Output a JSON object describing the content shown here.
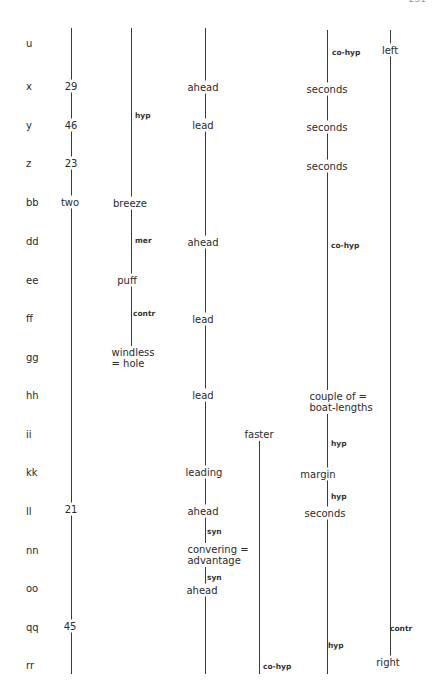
{
  "page_number": "231",
  "row_labels": [
    {
      "label": "u",
      "y": 43
    },
    {
      "label": "x",
      "y": 86
    },
    {
      "label": "y",
      "y": 125
    },
    {
      "label": "z",
      "y": 163
    },
    {
      "label": "bb",
      "y": 202
    },
    {
      "label": "dd",
      "y": 241
    },
    {
      "label": "ee",
      "y": 280
    },
    {
      "label": "ff",
      "y": 318
    },
    {
      "label": "gg",
      "y": 357
    },
    {
      "label": "hh",
      "y": 395
    },
    {
      "label": "ii",
      "y": 434
    },
    {
      "label": "kk",
      "y": 472
    },
    {
      "label": "ll",
      "y": 511
    },
    {
      "label": "nn",
      "y": 550
    },
    {
      "label": "oo",
      "y": 588
    },
    {
      "label": "qq",
      "y": 627
    },
    {
      "label": "rr",
      "y": 665
    }
  ],
  "columns": {
    "col1": {
      "terms": {
        "x": "29",
        "y": "46",
        "z": "23",
        "bb": "two",
        "ll": "21",
        "qq": "45"
      }
    },
    "col2": {
      "terms": {
        "bb": "breeze",
        "ee": "puff",
        "gg": "windless\n= hole"
      },
      "relations": {
        "hyp": "hyp",
        "mer": "mer",
        "contr": "contr"
      }
    },
    "col3": {
      "terms": {
        "x": "ahead",
        "y": "lead",
        "dd": "ahead",
        "ff": "lead",
        "hh": "lead",
        "kk": "leading",
        "ll": "ahead",
        "nn": "convering =\nadvantage",
        "oo": "ahead"
      },
      "relations": {
        "syn1": "syn",
        "syn2": "syn"
      }
    },
    "col_faster": {
      "terms": {
        "top": "faster"
      },
      "relations": {
        "cohyp": "co-hyp"
      }
    },
    "col4": {
      "terms": {
        "x": "seconds",
        "y": "seconds",
        "z": "seconds",
        "hh": "couple of =\nboat-lengths",
        "kk": "margin",
        "ll": "seconds"
      },
      "relations": {
        "cohyp1": "co-hyp",
        "cohyp2": "co-hyp",
        "hyp1": "hyp",
        "hyp2": "hyp",
        "hyp3": "hyp"
      }
    },
    "col5": {
      "terms": {
        "u": "left",
        "rr": "right"
      },
      "relations": {
        "contr": "contr"
      }
    }
  }
}
